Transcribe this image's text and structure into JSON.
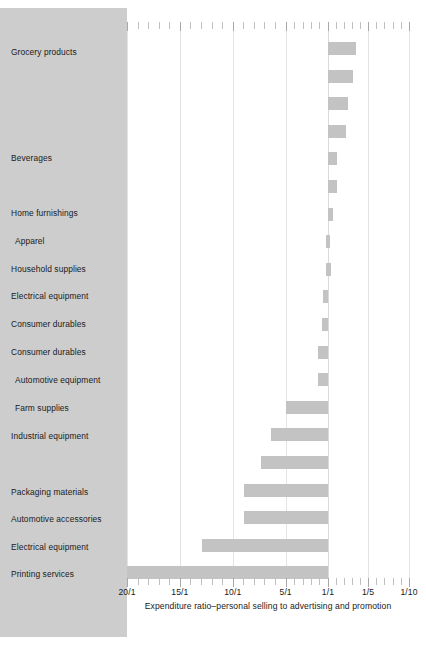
{
  "chart_data": {
    "type": "bar",
    "title": "",
    "subtitle": "",
    "xlabel": "Expenditure ratio–personal selling to advertising and promotion",
    "ylabel": "",
    "orientation": "horizontal",
    "grid": true,
    "legend": null,
    "axis_note": "Axis is reversed: 20/1 at left edge, 1/10 at right edge. Baseline at 1/1. Bars left of baseline = selling-heavy (ratio > 1/1); bars right of baseline = advertising-heavy (ratio < 1/1).",
    "xticks": [
      {
        "label": "20/1",
        "value": 20,
        "pos_pct": 0
      },
      {
        "label": "15/1",
        "value": 15,
        "pos_pct": 18.75
      },
      {
        "label": "10/1",
        "value": 10,
        "pos_pct": 37.5
      },
      {
        "label": "5/1",
        "value": 5,
        "pos_pct": 56.25
      },
      {
        "label": "1/1",
        "value": 1,
        "pos_pct": 71.25
      },
      {
        "label": "1/5",
        "value": 0.2,
        "pos_pct": 85.5
      },
      {
        "label": "1/10",
        "value": 0.1,
        "pos_pct": 100
      }
    ],
    "xlim": [
      "20/1",
      "1/10"
    ],
    "baseline_pos_pct": 71.25,
    "categories": [
      "Grocery products",
      "Beverages",
      "Home furnishings",
      "Apparel",
      "Household supplies",
      "Electrical equipment",
      "Consumer durables",
      "Consumer durables",
      "Automotive equipment",
      "Farm supplies",
      "Industrial equipment",
      "Packaging materials",
      "Automotive accessories",
      "Electrical equipment",
      "Printing services"
    ],
    "bars": [
      {
        "index": 1,
        "label": "Grocery products",
        "ratio": "1/2.6",
        "value": 0.385,
        "start_pct": 71.25,
        "end_pct": 81.2
      },
      {
        "index": 2,
        "label": "",
        "ratio": "1/2.4",
        "value": 0.417,
        "start_pct": 71.25,
        "end_pct": 80.2
      },
      {
        "index": 3,
        "label": "",
        "ratio": "1/2.0",
        "value": 0.5,
        "start_pct": 71.25,
        "end_pct": 78.4
      },
      {
        "index": 4,
        "label": "",
        "ratio": "1/1.8",
        "value": 0.556,
        "start_pct": 71.25,
        "end_pct": 77.5
      },
      {
        "index": 5,
        "label": "Beverages",
        "ratio": "1/1.3",
        "value": 0.77,
        "start_pct": 71.25,
        "end_pct": 74.6
      },
      {
        "index": 6,
        "label": "",
        "ratio": "1/1.3",
        "value": 0.77,
        "start_pct": 71.25,
        "end_pct": 74.6
      },
      {
        "index": 7,
        "label": "Home furnishings",
        "ratio": "1/1.15",
        "value": 0.87,
        "start_pct": 71.25,
        "end_pct": 73.2
      },
      {
        "index": 8,
        "label": "Apparel",
        "ratio": "1/1.05",
        "value": 0.95,
        "start_pct": 70.6,
        "end_pct": 72.0
      },
      {
        "index": 9,
        "label": "Household supplies",
        "ratio": "1/1.05",
        "value": 0.95,
        "start_pct": 70.6,
        "end_pct": 72.2
      },
      {
        "index": 10,
        "label": "Electrical equipment",
        "ratio": "1.1/1",
        "value": 1.1,
        "start_pct": 69.5,
        "end_pct": 71.25
      },
      {
        "index": 11,
        "label": "Consumer durables",
        "ratio": "1.2/1",
        "value": 1.2,
        "start_pct": 69.0,
        "end_pct": 71.25
      },
      {
        "index": 12,
        "label": "Consumer durables",
        "ratio": "1.5/1",
        "value": 1.5,
        "start_pct": 67.6,
        "end_pct": 71.25
      },
      {
        "index": 13,
        "label": "Automotive equipment",
        "ratio": "1.5/1",
        "value": 1.5,
        "start_pct": 67.6,
        "end_pct": 71.25
      },
      {
        "index": 14,
        "label": "Farm supplies",
        "ratio": "5/1",
        "value": 5.0,
        "start_pct": 56.25,
        "end_pct": 71.25
      },
      {
        "index": 15,
        "label": "Industrial equipment",
        "ratio": "6.2/1",
        "value": 6.2,
        "start_pct": 51.0,
        "end_pct": 71.25
      },
      {
        "index": 16,
        "label": "",
        "ratio": "7/1",
        "value": 7.0,
        "start_pct": 47.5,
        "end_pct": 71.25
      },
      {
        "index": 17,
        "label": "Packaging materials",
        "ratio": "8.6/1",
        "value": 8.6,
        "start_pct": 41.5,
        "end_pct": 71.25
      },
      {
        "index": 18,
        "label": "Automotive accessories",
        "ratio": "8.6/1",
        "value": 8.6,
        "start_pct": 41.5,
        "end_pct": 71.25
      },
      {
        "index": 19,
        "label": "Electrical equipment",
        "ratio": "11.8/1",
        "value": 11.8,
        "start_pct": 26.5,
        "end_pct": 71.25
      },
      {
        "index": 20,
        "label": "Printing services",
        "ratio": "20/1",
        "value": 20.0,
        "start_pct": 0,
        "end_pct": 71.25
      }
    ],
    "colors": {
      "bar": "#c3c3c3",
      "panel": "#cdcdcd",
      "plot_background": "#ffffff",
      "gridline": "#e3e3e3",
      "text": "#1a1a1a"
    }
  },
  "labels_layout": [
    {
      "text": "Grocery products",
      "top": 47
    },
    {
      "text": "Beverages",
      "top": 153
    },
    {
      "text": "Home furnishings",
      "top": 208
    },
    {
      "text": "Apparel",
      "top": 236,
      "indent": 4
    },
    {
      "text": "Household supplies",
      "top": 264
    },
    {
      "text": "Electrical equipment",
      "top": 291
    },
    {
      "text": "Consumer durables",
      "top": 319
    },
    {
      "text": "Consumer durables",
      "top": 347
    },
    {
      "text": "Automotive equipment",
      "top": 375,
      "indent": 4
    },
    {
      "text": "Farm supplies",
      "top": 403,
      "indent": 4
    },
    {
      "text": "Industrial equipment",
      "top": 431
    },
    {
      "text": "Packaging materials",
      "top": 487
    },
    {
      "text": "Automotive accessories",
      "top": 514
    },
    {
      "text": "Electrical equipment",
      "top": 542
    },
    {
      "text": "Printing services",
      "top": 569
    }
  ]
}
